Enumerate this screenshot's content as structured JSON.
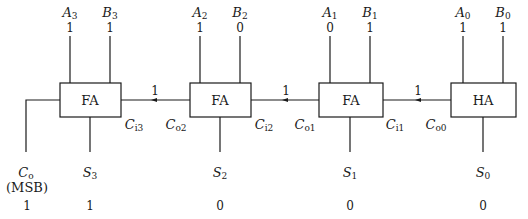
{
  "diagram": {
    "blocks": [
      {
        "id": "fa3",
        "label": "FA",
        "carry_in_label": "C",
        "carry_in_sub": "i3"
      },
      {
        "id": "fa2",
        "label": "FA",
        "carry_out_label": "C",
        "carry_out_sub": "o2",
        "carry_in_label": "C",
        "carry_in_sub": "i2"
      },
      {
        "id": "fa1",
        "label": "FA",
        "carry_out_label": "C",
        "carry_out_sub": "o1",
        "carry_in_label": "C",
        "carry_in_sub": "i1"
      },
      {
        "id": "ha0",
        "label": "HA",
        "carry_out_label": "C",
        "carry_out_sub": "o0"
      }
    ],
    "inputs": [
      {
        "name": "A",
        "sub": "3",
        "value": "1"
      },
      {
        "name": "B",
        "sub": "3",
        "value": "1"
      },
      {
        "name": "A",
        "sub": "2",
        "value": "1"
      },
      {
        "name": "B",
        "sub": "2",
        "value": "0"
      },
      {
        "name": "A",
        "sub": "1",
        "value": "0"
      },
      {
        "name": "B",
        "sub": "1",
        "value": "1"
      },
      {
        "name": "A",
        "sub": "0",
        "value": "1"
      },
      {
        "name": "B",
        "sub": "0",
        "value": "1"
      }
    ],
    "carries": [
      {
        "value": "1"
      },
      {
        "value": "1"
      },
      {
        "value": "1"
      }
    ],
    "outputs": [
      {
        "name": "C",
        "sub": "o",
        "note": "(MSB)",
        "value": "1"
      },
      {
        "name": "S",
        "sub": "3",
        "value": "1"
      },
      {
        "name": "S",
        "sub": "2",
        "value": "0"
      },
      {
        "name": "S",
        "sub": "1",
        "value": "0"
      },
      {
        "name": "S",
        "sub": "0",
        "value": "0"
      }
    ]
  }
}
